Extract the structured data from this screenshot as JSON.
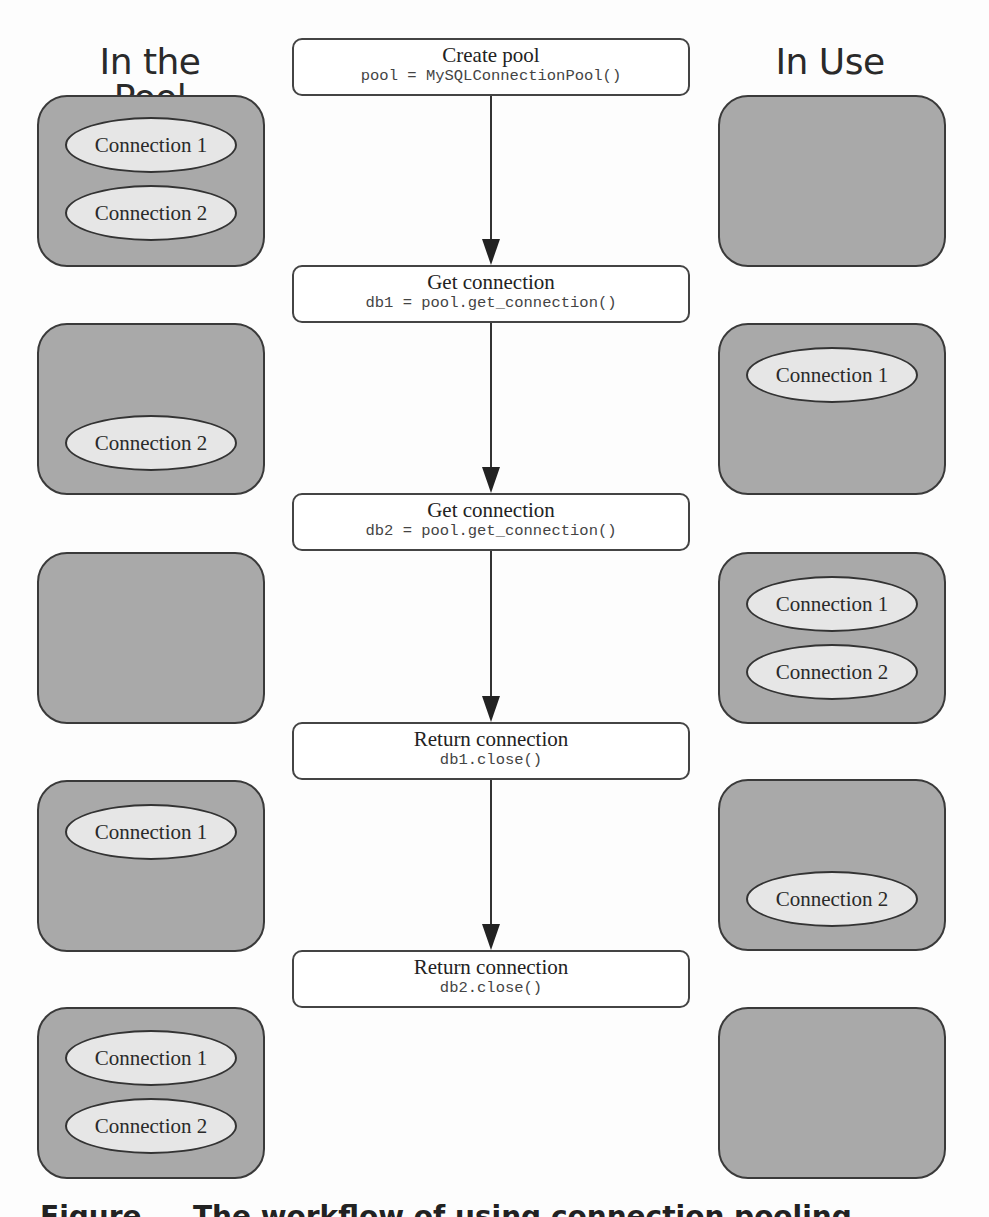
{
  "headers": {
    "left": "In the Pool",
    "right": "In Use"
  },
  "steps": [
    {
      "title": "Create pool",
      "code": "pool = MySQLConnectionPool()"
    },
    {
      "title": "Get connection",
      "code": "db1 = pool.get_connection()"
    },
    {
      "title": "Get connection",
      "code": "db2 = pool.get_connection()"
    },
    {
      "title": "Return connection",
      "code": "db1.close()"
    },
    {
      "title": "Return connection",
      "code": "db2.close()"
    }
  ],
  "states": [
    {
      "pool": [
        "Connection 1",
        "Connection 2"
      ],
      "in_use": []
    },
    {
      "pool": [
        "Connection 2"
      ],
      "in_use": [
        "Connection 1"
      ]
    },
    {
      "pool": [],
      "in_use": [
        "Connection 1",
        "Connection 2"
      ]
    },
    {
      "pool": [
        "Connection 1"
      ],
      "in_use": [
        "Connection 2"
      ]
    },
    {
      "pool": [
        "Connection 1",
        "Connection 2"
      ],
      "in_use": []
    }
  ],
  "labels": {
    "conn1": "Connection 1",
    "conn2": "Connection 2"
  },
  "caption": "Figure ... The workflow of using connection pooling",
  "colors": {
    "state_fill": "#a9a9a9",
    "connection_fill": "#e6e6e6",
    "border": "#333333"
  }
}
